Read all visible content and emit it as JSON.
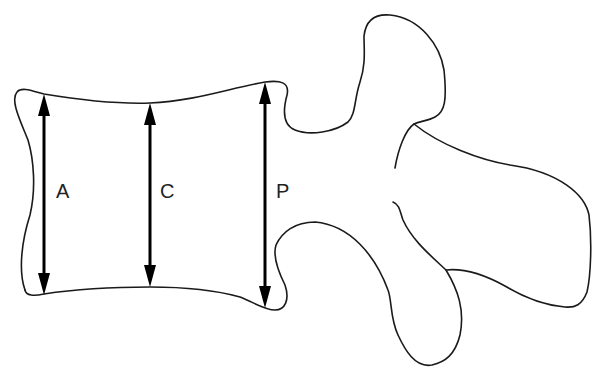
{
  "figure": {
    "stroke_color": "#1a1a1a",
    "arrow_color": "#000000",
    "background": "#ffffff"
  },
  "measurements": [
    {
      "id": "anterior",
      "label": "A",
      "x": 44,
      "y_top": 94,
      "y_bottom": 295
    },
    {
      "id": "central",
      "label": "C",
      "x": 150,
      "y_top": 103,
      "y_bottom": 287
    },
    {
      "id": "posterior",
      "label": "P",
      "x": 265,
      "y_top": 82,
      "y_bottom": 308
    }
  ]
}
